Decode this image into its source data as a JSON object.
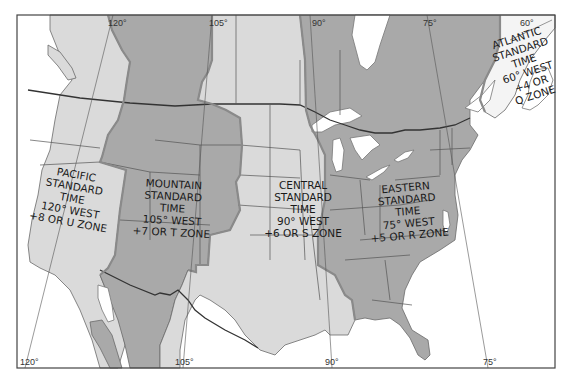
{
  "map": {
    "title": "North American Standard Time Zones",
    "colors": {
      "zone_dark": "#a9a9a9",
      "zone_light": "#dadada",
      "water": "#ffffff",
      "frame": "#444444"
    },
    "meridians_top": [
      "120°",
      "105°",
      "90°",
      "75°",
      "60°"
    ],
    "meridians_bottom": [
      "120°",
      "105°",
      "90°",
      "75°"
    ],
    "zones": [
      {
        "name": "pacific",
        "lines": [
          "PACIFIC",
          "STANDARD",
          "TIME",
          "120° WEST",
          "+8 OR U ZONE"
        ]
      },
      {
        "name": "mountain",
        "lines": [
          "MOUNTAIN",
          "STANDARD",
          "TIME",
          "105° WEST",
          "+7 OR T ZONE"
        ]
      },
      {
        "name": "central",
        "lines": [
          "CENTRAL",
          "STANDARD",
          "TIME",
          "90° WEST",
          "+6 OR S ZONE"
        ]
      },
      {
        "name": "eastern",
        "lines": [
          "EASTERN",
          "STANDARD",
          "TIME",
          "75° WEST",
          "+5 OR R ZONE"
        ]
      },
      {
        "name": "atlantic",
        "lines": [
          "ATLANTIC",
          "STANDARD",
          "TIME",
          "60° WEST",
          "+4 OR",
          "Q ZONE"
        ]
      }
    ]
  }
}
